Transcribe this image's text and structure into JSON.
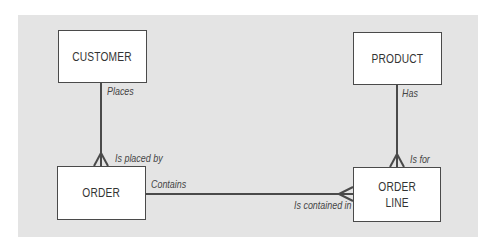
{
  "diagram": {
    "type": "entity-relationship",
    "entities": [
      {
        "id": "customer",
        "label": "CUSTOMER"
      },
      {
        "id": "product",
        "label": "PRODUCT"
      },
      {
        "id": "order",
        "label": "ORDER"
      },
      {
        "id": "order_line",
        "label": "ORDER\nLINE"
      }
    ],
    "relationships": [
      {
        "from": "customer",
        "to": "order",
        "from_label": "Places",
        "to_label": "Is placed by",
        "cardinality": "one-to-many"
      },
      {
        "from": "product",
        "to": "order_line",
        "from_label": "Has",
        "to_label": "Is for",
        "cardinality": "one-to-many"
      },
      {
        "from": "order",
        "to": "order_line",
        "from_label": "Contains",
        "to_label": "Is contained in",
        "cardinality": "one-to-many"
      }
    ]
  },
  "colors": {
    "panel": "#e4e4e4",
    "entity_fill": "#ffffff",
    "line": "#4a4a4a"
  }
}
